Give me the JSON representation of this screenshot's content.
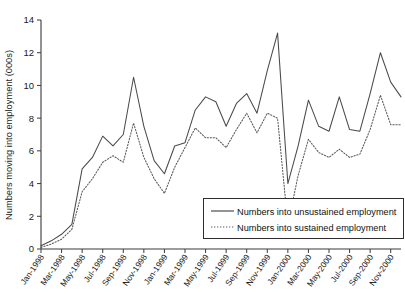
{
  "chart_data": {
    "type": "line",
    "title": "",
    "xlabel": "",
    "ylabel": "Numbers moving into employment (000s)",
    "ylim": [
      0,
      14
    ],
    "ytick_values": [
      0,
      2,
      4,
      6,
      8,
      10,
      12,
      14
    ],
    "ytick_labels": [
      "0",
      "2",
      "4",
      "6",
      "8",
      "10",
      "12",
      "14"
    ],
    "grid": false,
    "legend_position": "lower-right",
    "x": [
      "Jan-1998",
      "Feb-1998",
      "Mar-1998",
      "Apr-1998",
      "May-1998",
      "Jun-1998",
      "Jul-1998",
      "Aug-1998",
      "Sep-1998",
      "Oct-1998",
      "Nov-1998",
      "Dec-1998",
      "Jan-1999",
      "Feb-1999",
      "Mar-1999",
      "Apr-1999",
      "May-1999",
      "Jun-1999",
      "Jul-1999",
      "Aug-1999",
      "Sep-1999",
      "Oct-1999",
      "Nov-1999",
      "Dec-1999",
      "Jan-2000",
      "Feb-2000",
      "Mar-2000",
      "Apr-2000",
      "May-2000",
      "Jun-2000",
      "Jul-2000",
      "Aug-2000",
      "Sep-2000",
      "Oct-2000",
      "Nov-2000",
      "Dec-2000"
    ],
    "xtick_labels": [
      "Jan-1998",
      "Mar-1998",
      "May-1998",
      "Jul-1998",
      "Sep-1998",
      "Nov-1998",
      "Jan-1999",
      "Mar-1999",
      "May-1999",
      "Jul-1999",
      "Sep-1999",
      "Nov-1999",
      "Jan-2000",
      "Mar-2000",
      "May-2000",
      "Jul-2000",
      "Sep-2000",
      "Nov-2000"
    ],
    "xtick_indices": [
      0,
      2,
      4,
      6,
      8,
      10,
      12,
      14,
      16,
      18,
      20,
      22,
      24,
      26,
      28,
      30,
      32,
      34
    ],
    "series": [
      {
        "name": "Numbers into unsustained employment",
        "style": "solid",
        "color": "#4a4a4a",
        "values": [
          0.2,
          0.5,
          0.9,
          1.5,
          4.9,
          5.6,
          6.9,
          6.3,
          7.0,
          10.5,
          7.5,
          5.4,
          4.6,
          6.3,
          6.5,
          8.5,
          9.3,
          9.0,
          7.5,
          8.9,
          9.5,
          8.3,
          10.9,
          13.2,
          4.0,
          6.3,
          9.1,
          7.5,
          7.2,
          9.3,
          7.3,
          7.2,
          9.5,
          12.0,
          10.2,
          9.3
        ]
      },
      {
        "name": "Numbers into sustained employment",
        "style": "dotted",
        "color": "#5a5a5a",
        "values": [
          0.1,
          0.3,
          0.6,
          1.2,
          3.5,
          4.3,
          5.3,
          5.7,
          5.3,
          7.7,
          5.6,
          4.3,
          3.4,
          5.0,
          6.2,
          7.4,
          6.8,
          6.8,
          6.2,
          7.3,
          8.3,
          7.1,
          8.3,
          8.0,
          1.5,
          4.5,
          6.7,
          5.9,
          5.6,
          6.1,
          5.6,
          5.8,
          7.3,
          9.4,
          7.6,
          7.6
        ]
      }
    ],
    "legend_entries": [
      "Numbers into unsustained employment",
      "Numbers into sustained employment"
    ]
  },
  "axes": {
    "y_title": "Numbers moving into employment (000s)"
  }
}
